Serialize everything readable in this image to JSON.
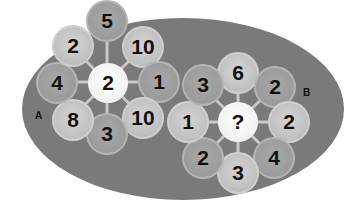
{
  "puzzle": {
    "wheel_a": {
      "label": "A",
      "center": "2",
      "outer": [
        "5",
        "10",
        "1",
        "10",
        "3",
        "8",
        "4",
        "2"
      ]
    },
    "wheel_b": {
      "label": "B",
      "center": "?",
      "outer": [
        "6",
        "2",
        "2",
        "4",
        "3",
        "2",
        "1",
        "3"
      ]
    }
  },
  "colors": {
    "background": "#ffffff",
    "ellipse": "#7a7a7a",
    "node_light": "#c4c4c4",
    "node_mid": "#9c9c9c",
    "center_node": "#f5f5f5",
    "spoke": "#c8c8c8",
    "text": "#111111"
  }
}
